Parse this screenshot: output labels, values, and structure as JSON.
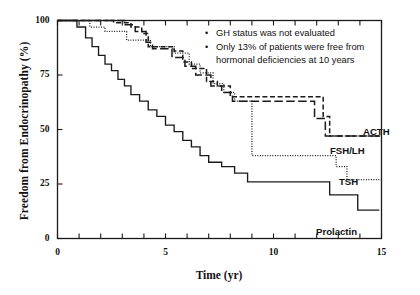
{
  "chart_data": {
    "type": "line",
    "subtype": "kaplan-meier-step",
    "title": "",
    "xlabel": "Time (yr)",
    "ylabel": "Freedom from Endocrinopathy (%)",
    "xlim": [
      0,
      15
    ],
    "ylim": [
      0,
      100
    ],
    "xticks": [
      0,
      1,
      2,
      3,
      4,
      5,
      6,
      7,
      8,
      9,
      10,
      11,
      12,
      13,
      14,
      15
    ],
    "xtick_labels": [
      "0",
      "",
      "",
      "",
      "",
      "5",
      "",
      "",
      "",
      "",
      "10",
      "",
      "",
      "",
      "",
      "15"
    ],
    "yticks": [
      0,
      25,
      50,
      75,
      100
    ],
    "ytick_labels": [
      "0",
      "25",
      "50",
      "75",
      "100"
    ],
    "grid": false,
    "legend": "inline-curve-labels",
    "frame": "box",
    "series": [
      {
        "name": "ACTH",
        "style": "dashed",
        "label": "ACTH",
        "points": [
          [
            0,
            100
          ],
          [
            2.6,
            100
          ],
          [
            2.6,
            99
          ],
          [
            3.4,
            99
          ],
          [
            3.4,
            97
          ],
          [
            3.9,
            97
          ],
          [
            3.9,
            94
          ],
          [
            4.2,
            94
          ],
          [
            4.2,
            88
          ],
          [
            5.4,
            88
          ],
          [
            5.4,
            86
          ],
          [
            5.8,
            86
          ],
          [
            5.8,
            81
          ],
          [
            6.2,
            81
          ],
          [
            6.2,
            78
          ],
          [
            6.9,
            78
          ],
          [
            6.9,
            72
          ],
          [
            7.4,
            72
          ],
          [
            7.4,
            70
          ],
          [
            8.0,
            70
          ],
          [
            8.0,
            65
          ],
          [
            12.3,
            65
          ],
          [
            12.3,
            56
          ],
          [
            12.6,
            56
          ],
          [
            12.6,
            47
          ],
          [
            15,
            47
          ]
        ]
      },
      {
        "name": "FSH/LH",
        "style": "long-dash",
        "label": "FSH/LH",
        "points": [
          [
            0,
            100
          ],
          [
            3.1,
            100
          ],
          [
            3.1,
            98
          ],
          [
            3.6,
            98
          ],
          [
            3.6,
            95
          ],
          [
            4.1,
            95
          ],
          [
            4.1,
            90
          ],
          [
            4.4,
            90
          ],
          [
            4.4,
            87
          ],
          [
            5.3,
            87
          ],
          [
            5.3,
            83
          ],
          [
            5.9,
            83
          ],
          [
            5.9,
            79
          ],
          [
            6.4,
            79
          ],
          [
            6.4,
            75
          ],
          [
            7.1,
            75
          ],
          [
            7.1,
            70
          ],
          [
            7.6,
            70
          ],
          [
            7.6,
            67
          ],
          [
            8.1,
            67
          ],
          [
            8.1,
            63
          ],
          [
            11.9,
            63
          ],
          [
            11.9,
            55
          ],
          [
            12.4,
            55
          ],
          [
            12.4,
            47
          ],
          [
            15,
            47
          ]
        ]
      },
      {
        "name": "TSH",
        "style": "dotted",
        "label": "TSH",
        "points": [
          [
            0,
            100
          ],
          [
            1.5,
            100
          ],
          [
            1.5,
            97
          ],
          [
            2.2,
            97
          ],
          [
            2.2,
            95
          ],
          [
            3.2,
            95
          ],
          [
            3.2,
            91
          ],
          [
            4.3,
            91
          ],
          [
            4.3,
            88
          ],
          [
            5.4,
            88
          ],
          [
            5.4,
            85
          ],
          [
            6.1,
            85
          ],
          [
            6.1,
            80
          ],
          [
            6.6,
            80
          ],
          [
            6.6,
            76
          ],
          [
            7.2,
            76
          ],
          [
            7.2,
            71
          ],
          [
            7.7,
            71
          ],
          [
            7.7,
            67
          ],
          [
            8.2,
            67
          ],
          [
            8.2,
            63
          ],
          [
            9.0,
            63
          ],
          [
            9.0,
            38
          ],
          [
            12.9,
            38
          ],
          [
            12.9,
            33
          ],
          [
            13.4,
            33
          ],
          [
            13.4,
            27
          ],
          [
            15,
            27
          ]
        ]
      },
      {
        "name": "Prolactin",
        "style": "solid",
        "label": "Prolactin",
        "points": [
          [
            0,
            100
          ],
          [
            0.9,
            100
          ],
          [
            0.9,
            97
          ],
          [
            1.3,
            97
          ],
          [
            1.3,
            92
          ],
          [
            1.6,
            92
          ],
          [
            1.6,
            88
          ],
          [
            1.9,
            88
          ],
          [
            1.9,
            84
          ],
          [
            2.2,
            84
          ],
          [
            2.2,
            80
          ],
          [
            2.5,
            80
          ],
          [
            2.5,
            77
          ],
          [
            2.8,
            77
          ],
          [
            2.8,
            73
          ],
          [
            3.1,
            73
          ],
          [
            3.1,
            70
          ],
          [
            3.4,
            70
          ],
          [
            3.4,
            66
          ],
          [
            3.8,
            66
          ],
          [
            3.8,
            63
          ],
          [
            4.2,
            63
          ],
          [
            4.2,
            59
          ],
          [
            4.6,
            59
          ],
          [
            4.6,
            56
          ],
          [
            5.0,
            56
          ],
          [
            5.0,
            52
          ],
          [
            5.4,
            52
          ],
          [
            5.4,
            49
          ],
          [
            5.8,
            49
          ],
          [
            5.8,
            45
          ],
          [
            6.2,
            45
          ],
          [
            6.2,
            42
          ],
          [
            6.6,
            42
          ],
          [
            6.6,
            38
          ],
          [
            7.0,
            38
          ],
          [
            7.0,
            35
          ],
          [
            7.6,
            35
          ],
          [
            7.6,
            33
          ],
          [
            8.2,
            33
          ],
          [
            8.2,
            30
          ],
          [
            8.8,
            30
          ],
          [
            8.8,
            26
          ],
          [
            12.6,
            26
          ],
          [
            12.6,
            20
          ],
          [
            13.9,
            20
          ],
          [
            13.9,
            13
          ],
          [
            14.9,
            13
          ]
        ]
      }
    ],
    "annotations": [
      "GH status was not evaluated",
      "Only 13% of patients were free from hormonal deficiencies at 10 years"
    ]
  },
  "axes": {
    "xlabel": "Time (yr)",
    "ylabel": "Freedom from Endocrinopathy (%)",
    "xtick_labels": [
      {
        "value": 0,
        "text": "0"
      },
      {
        "value": 5,
        "text": "5"
      },
      {
        "value": 10,
        "text": "10"
      },
      {
        "value": 15,
        "text": "15"
      }
    ],
    "ytick_labels": [
      {
        "value": 100,
        "text": "100"
      },
      {
        "value": 75,
        "text": "75"
      },
      {
        "value": 50,
        "text": "50"
      },
      {
        "value": 25,
        "text": "25"
      },
      {
        "value": 0,
        "text": "0"
      }
    ]
  },
  "notes": {
    "bullet_glyph": "•",
    "line1": "GH status was not evaluated",
    "line2a": "Only 13% of patients were free from",
    "line2b": "hormonal deficiencies at 10 years"
  },
  "curve_labels": {
    "acth": "ACTH",
    "fshlh": "FSH/LH",
    "tsh": "TSH",
    "prolactin": "Prolactin"
  },
  "colors": {
    "axis": "#1a1a1a",
    "curve": "#1a1a1a",
    "text": "#111111",
    "background": "#ffffff"
  }
}
